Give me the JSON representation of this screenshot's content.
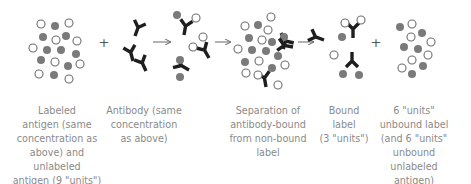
{
  "diagram": {
    "operators": {
      "plus": "+",
      "arrow": "→"
    },
    "colors": {
      "labeled_antigen_fill": "#7a7a7a",
      "unlabeled_antigen_stroke": "#6e6e6e",
      "antibody": "#1e1e1e",
      "arrow": "#666666",
      "caption_text": "#8a8a8a"
    },
    "legend_semantics": {
      "filled_circle": "labeled antigen",
      "open_circle": "unlabeled antigen",
      "Y_shape": "antibody"
    },
    "stages": [
      {
        "id": "mixture",
        "caption": "Labeled\nantigen (same\nconcentration as\nabove) and\nunlabeled\nantigen (9 \"units\")"
      },
      {
        "id": "antibody",
        "caption": "Antibody (same\nconcentration\nas above)"
      },
      {
        "id": "separation",
        "caption": "Separation of\nantibody-bound\nfrom non-bound\nlabel"
      },
      {
        "id": "bound",
        "caption": "Bound\nlabel\n(3 \"units\")"
      },
      {
        "id": "unbound",
        "caption": "6 \"units\"\nunbound label\n(and 6 \"units\"\nunbound\nunlabeled\nantigen)"
      }
    ]
  }
}
